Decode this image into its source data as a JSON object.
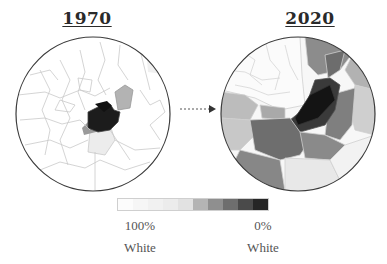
{
  "maps": [
    {
      "id": "map-1970",
      "title": "1970"
    },
    {
      "id": "map-2020",
      "title": "2020"
    }
  ],
  "arrow": {
    "style": "dotted",
    "direction": "right"
  },
  "legend": {
    "swatches": [
      "#fcfcfc",
      "#f6f6f6",
      "#f1f1f1",
      "#ececec",
      "#e2e2e2",
      "#b4b4b4",
      "#8f8f8f",
      "#6e6e6e",
      "#4a4a4a",
      "#262626"
    ],
    "left_value": "100%",
    "left_label": "White",
    "right_value": "0%",
    "right_label": "White"
  },
  "colors": {
    "outline": "#3a3a3a",
    "border_lines": "#c9c9c9"
  }
}
